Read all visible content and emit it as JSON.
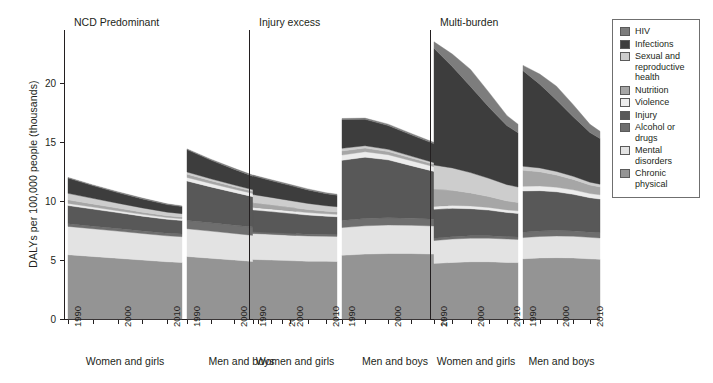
{
  "figure": {
    "ylabel": "DALYs per 100,000 people (thousands)",
    "y_ticks": [
      "0",
      "5",
      "10",
      "15",
      "20"
    ],
    "x_ticks": [
      "1990",
      "2000",
      "2010"
    ],
    "group_labels": [
      "Women and girls",
      "Men and boys"
    ],
    "panel_titles": [
      "NCD Predominant",
      "Injury excess",
      "Multi-burden"
    ]
  },
  "legend": {
    "items": [
      {
        "label": "HIV",
        "color": "#7d7d7d"
      },
      {
        "label": "Infections",
        "color": "#3d3d3d"
      },
      {
        "label": "Sexual and reproductive health",
        "color": "#cdcdcd"
      },
      {
        "label": "Nutrition",
        "color": "#a6a6a6"
      },
      {
        "label": "Violence",
        "color": "#ececec"
      },
      {
        "label": "Injury",
        "color": "#585858"
      },
      {
        "label": "Alcohol or drugs",
        "color": "#6e6e6e"
      },
      {
        "label": "Mental disorders",
        "color": "#e3e3e3"
      },
      {
        "label": "Chronic physical",
        "color": "#949494"
      }
    ]
  },
  "chart_data": {
    "type": "area",
    "title": "",
    "xlabel": "",
    "ylabel": "DALYs per 100,000 people (thousands)",
    "ylim": [
      0,
      24.5
    ],
    "yticks": [
      0,
      5,
      10,
      15,
      20
    ],
    "xlim": [
      1990,
      2013
    ],
    "xticks": [
      1990,
      2000,
      2010
    ],
    "grid": false,
    "legend_position": "right",
    "stack_order_bottom_to_top": [
      "Chronic physical",
      "Mental disorders",
      "Alcohol or drugs",
      "Injury",
      "Violence",
      "Nutrition",
      "Sexual and reproductive health",
      "Infections",
      "HIV"
    ],
    "colors": {
      "HIV": "#7d7d7d",
      "Infections": "#3d3d3d",
      "Sexual and reproductive health": "#cdcdcd",
      "Nutrition": "#a6a6a6",
      "Violence": "#ececec",
      "Injury": "#585858",
      "Alcohol or drugs": "#6e6e6e",
      "Mental disorders": "#e3e3e3",
      "Chronic physical": "#949494"
    },
    "panels": [
      {
        "title": "NCD Predominant",
        "groups": [
          {
            "name": "Women and girls",
            "x": [
              1990,
              1995,
              2000,
              2005,
              2010,
              2013
            ],
            "series": [
              {
                "name": "Chronic physical",
                "values": [
                  5.45,
                  5.3,
                  5.15,
                  5.0,
                  4.85,
                  4.8
                ]
              },
              {
                "name": "Mental disorders",
                "values": [
                  2.4,
                  2.35,
                  2.3,
                  2.25,
                  2.2,
                  2.18
                ]
              },
              {
                "name": "Alcohol or drugs",
                "values": [
                  0.22,
                  0.22,
                  0.22,
                  0.22,
                  0.22,
                  0.22
                ]
              },
              {
                "name": "Injury",
                "values": [
                  1.55,
                  1.45,
                  1.35,
                  1.25,
                  1.18,
                  1.15
                ]
              },
              {
                "name": "Violence",
                "values": [
                  0.18,
                  0.17,
                  0.16,
                  0.15,
                  0.15,
                  0.15
                ]
              },
              {
                "name": "Nutrition",
                "values": [
                  0.3,
                  0.26,
                  0.22,
                  0.19,
                  0.16,
                  0.15
                ]
              },
              {
                "name": "Sexual and reproductive health",
                "values": [
                  0.55,
                  0.48,
                  0.42,
                  0.36,
                  0.3,
                  0.28
                ]
              },
              {
                "name": "Infections",
                "values": [
                  1.3,
                  1.08,
                  0.9,
                  0.76,
                  0.64,
                  0.6
                ]
              },
              {
                "name": "HIV",
                "values": [
                  0.05,
                  0.06,
                  0.07,
                  0.07,
                  0.06,
                  0.06
                ]
              }
            ],
            "totals": [
              12.0,
              11.37,
              10.79,
              10.25,
              9.76,
              9.59
            ]
          },
          {
            "name": "Men and boys",
            "x": [
              1990,
              1995,
              2000,
              2005,
              2010,
              2013
            ],
            "series": [
              {
                "name": "Chronic physical",
                "values": [
                  5.3,
                  5.15,
                  5.0,
                  4.85,
                  4.72,
                  4.68
                ]
              },
              {
                "name": "Mental disorders",
                "values": [
                  2.35,
                  2.3,
                  2.25,
                  2.2,
                  2.16,
                  2.14
                ]
              },
              {
                "name": "Alcohol or drugs",
                "values": [
                  0.7,
                  0.7,
                  0.7,
                  0.7,
                  0.7,
                  0.7
                ]
              },
              {
                "name": "Injury",
                "values": [
                  3.35,
                  3.05,
                  2.78,
                  2.52,
                  2.3,
                  2.22
                ]
              },
              {
                "name": "Violence",
                "values": [
                  0.3,
                  0.29,
                  0.28,
                  0.27,
                  0.26,
                  0.26
                ]
              },
              {
                "name": "Nutrition",
                "values": [
                  0.28,
                  0.24,
                  0.21,
                  0.18,
                  0.15,
                  0.14
                ]
              },
              {
                "name": "Sexual and reproductive health",
                "values": [
                  0.18,
                  0.16,
                  0.14,
                  0.12,
                  0.11,
                  0.1
                ]
              },
              {
                "name": "Infections",
                "values": [
                  1.9,
                  1.58,
                  1.32,
                  1.1,
                  0.94,
                  0.88
                ]
              },
              {
                "name": "HIV",
                "values": [
                  0.06,
                  0.08,
                  0.09,
                  0.09,
                  0.08,
                  0.08
                ]
              }
            ],
            "totals": [
              14.42,
              13.55,
              12.77,
              12.03,
              11.42,
              11.2
            ]
          }
        ]
      },
      {
        "title": "Injury excess",
        "groups": [
          {
            "name": "Women and girls",
            "x": [
              1990,
              1995,
              2000,
              2005,
              2010,
              2013
            ],
            "series": [
              {
                "name": "Chronic physical",
                "values": [
                  5.05,
                  5.0,
                  4.95,
                  4.9,
                  4.9,
                  4.88
                ]
              },
              {
                "name": "Mental disorders",
                "values": [
                  2.2,
                  2.18,
                  2.16,
                  2.14,
                  2.12,
                  2.12
                ]
              },
              {
                "name": "Alcohol or drugs",
                "values": [
                  0.15,
                  0.15,
                  0.15,
                  0.15,
                  0.15,
                  0.15
                ]
              },
              {
                "name": "Injury",
                "values": [
                  1.85,
                  1.78,
                  1.7,
                  1.62,
                  1.55,
                  1.52
                ]
              },
              {
                "name": "Violence",
                "values": [
                  0.22,
                  0.22,
                  0.21,
                  0.21,
                  0.2,
                  0.2
                ]
              },
              {
                "name": "Nutrition",
                "values": [
                  0.38,
                  0.34,
                  0.3,
                  0.26,
                  0.22,
                  0.21
                ]
              },
              {
                "name": "Sexual and reproductive health",
                "values": [
                  0.7,
                  0.64,
                  0.58,
                  0.52,
                  0.46,
                  0.44
                ]
              },
              {
                "name": "Infections",
                "values": [
                  1.58,
                  1.42,
                  1.28,
                  1.14,
                  1.02,
                  0.98
                ]
              },
              {
                "name": "HIV",
                "values": [
                  0.07,
                  0.08,
                  0.09,
                  0.09,
                  0.08,
                  0.08
                ]
              }
            ],
            "totals": [
              12.2,
              11.81,
              11.42,
              11.03,
              10.7,
              10.58
            ]
          },
          {
            "name": "Men and boys",
            "x": [
              1990,
              1995,
              2000,
              2005,
              2010,
              2013
            ],
            "series": [
              {
                "name": "Chronic physical",
                "values": [
                  5.4,
                  5.5,
                  5.55,
                  5.55,
                  5.5,
                  5.48
                ]
              },
              {
                "name": "Mental disorders",
                "values": [
                  2.35,
                  2.4,
                  2.42,
                  2.4,
                  2.38,
                  2.36
                ]
              },
              {
                "name": "Alcohol or drugs",
                "values": [
                  0.6,
                  0.62,
                  0.62,
                  0.6,
                  0.58,
                  0.58
                ]
              },
              {
                "name": "Injury",
                "values": [
                  5.1,
                  5.2,
                  4.9,
                  4.45,
                  4.05,
                  3.9
                ]
              },
              {
                "name": "Violence",
                "values": [
                  0.45,
                  0.46,
                  0.44,
                  0.42,
                  0.4,
                  0.39
                ]
              },
              {
                "name": "Nutrition",
                "values": [
                  0.35,
                  0.31,
                  0.27,
                  0.23,
                  0.2,
                  0.19
                ]
              },
              {
                "name": "Sexual and reproductive health",
                "values": [
                  0.22,
                  0.2,
                  0.18,
                  0.16,
                  0.14,
                  0.13
                ]
              },
              {
                "name": "Infections",
                "values": [
                  2.45,
                  2.24,
                  2.02,
                  1.8,
                  1.6,
                  1.54
                ]
              },
              {
                "name": "HIV",
                "values": [
                  0.08,
                  0.1,
                  0.12,
                  0.12,
                  0.11,
                  0.1
                ]
              }
            ],
            "totals": [
              17.0,
              18.5,
              17.2,
              16.05,
              15.25,
              14.95
            ]
          }
        ]
      },
      {
        "title": "Multi-burden",
        "groups": [
          {
            "name": "Women and girls",
            "x": [
              1990,
              1995,
              2000,
              2005,
              2010,
              2013
            ],
            "series": [
              {
                "name": "Chronic physical",
                "values": [
                  4.7,
                  4.8,
                  4.85,
                  4.85,
                  4.8,
                  4.78
                ]
              },
              {
                "name": "Mental disorders",
                "values": [
                  1.95,
                  1.98,
                  2.0,
                  2.0,
                  1.98,
                  1.97
                ]
              },
              {
                "name": "Alcohol or drugs",
                "values": [
                  0.2,
                  0.2,
                  0.2,
                  0.2,
                  0.2,
                  0.2
                ]
              },
              {
                "name": "Injury",
                "values": [
                  2.45,
                  2.4,
                  2.3,
                  2.18,
                  2.05,
                  2.0
                ]
              },
              {
                "name": "Violence",
                "values": [
                  0.25,
                  0.25,
                  0.24,
                  0.23,
                  0.22,
                  0.22
                ]
              },
              {
                "name": "Nutrition",
                "values": [
                  1.45,
                  1.28,
                  1.1,
                  0.92,
                  0.76,
                  0.7
                ]
              },
              {
                "name": "Sexual and reproductive health",
                "values": [
                  2.05,
                  1.9,
                  1.72,
                  1.55,
                  1.38,
                  1.32
                ]
              },
              {
                "name": "Infections",
                "values": [
                  9.9,
                  8.6,
                  7.3,
                  6.05,
                  5.0,
                  4.6
                ]
              },
              {
                "name": "HIV",
                "values": [
                  0.55,
                  1.05,
                  1.45,
                  1.25,
                  0.85,
                  0.72
                ]
              }
            ],
            "totals": [
              23.5,
              22.46,
              21.16,
              19.23,
              17.24,
              16.51
            ]
          },
          {
            "name": "Men and boys",
            "x": [
              1990,
              1995,
              2000,
              2005,
              2010,
              2013
            ],
            "series": [
              {
                "name": "Chronic physical",
                "values": [
                  5.1,
                  5.18,
                  5.2,
                  5.18,
                  5.1,
                  5.06
                ]
              },
              {
                "name": "Mental disorders",
                "values": [
                  1.8,
                  1.82,
                  1.84,
                  1.84,
                  1.82,
                  1.81
                ]
              },
              {
                "name": "Alcohol or drugs",
                "values": [
                  0.45,
                  0.46,
                  0.46,
                  0.45,
                  0.44,
                  0.44
                ]
              },
              {
                "name": "Injury",
                "values": [
                  3.5,
                  3.42,
                  3.28,
                  3.1,
                  2.92,
                  2.86
                ]
              },
              {
                "name": "Violence",
                "values": [
                  0.4,
                  0.4,
                  0.39,
                  0.38,
                  0.36,
                  0.36
                ]
              },
              {
                "name": "Nutrition",
                "values": [
                  1.35,
                  1.2,
                  1.04,
                  0.88,
                  0.72,
                  0.67
                ]
              },
              {
                "name": "Sexual and reproductive health",
                "values": [
                  0.35,
                  0.33,
                  0.3,
                  0.27,
                  0.24,
                  0.23
                ]
              },
              {
                "name": "Infections",
                "values": [
                  8.1,
                  7.1,
                  6.05,
                  5.05,
                  4.2,
                  3.88
                ]
              },
              {
                "name": "HIV",
                "values": [
                  0.45,
                  0.85,
                  1.18,
                  1.02,
                  0.7,
                  0.6
                ]
              }
            ],
            "totals": [
              21.5,
              20.76,
              19.74,
              18.17,
              16.5,
              15.91
            ]
          }
        ]
      }
    ]
  }
}
